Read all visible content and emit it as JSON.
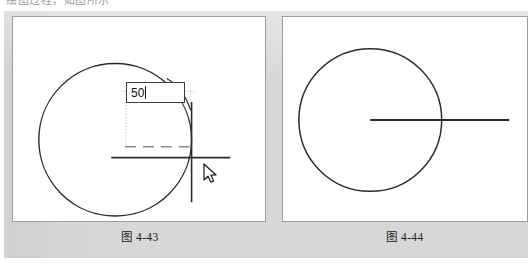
{
  "page": {
    "cropped_top_text": "绘图过程，如图所示"
  },
  "colors": {
    "plate_background": "#d7d7d7",
    "canvas_background": "#ffffff",
    "canvas_border": "#9c9c9c",
    "geometry_stroke": "#2b2b2b",
    "guide_dotted": "#b9b9b9",
    "guide_dashed": "#8a8a8a",
    "input_border": "#3d3d3d",
    "input_text": "#111111"
  },
  "figures": [
    {
      "id": "figure-4-43",
      "caption": "图 4-43",
      "canvas": {
        "width": 254,
        "height": 206
      },
      "circle": {
        "cx": 103,
        "cy": 124,
        "r": 77
      },
      "horizontal_line": {
        "x1": 99,
        "y1": 142,
        "x2": 219,
        "y2": 142
      },
      "vertical_line": {
        "x1": 180,
        "y1": 86,
        "x2": 180,
        "y2": 187
      },
      "guides": {
        "dotted_vertical_left": {
          "x": 114,
          "y1": 74,
          "y2": 131
        },
        "dotted_vertical_right": {
          "x": 179,
          "y1": 74,
          "y2": 88
        },
        "dotted_horizontal_top": {
          "y": 75,
          "x1": 110,
          "x2": 183
        },
        "dashed_horizontal": {
          "y": 131,
          "x1": 113,
          "x2": 180
        }
      },
      "leader_line": {
        "x1": 155,
        "y1": 62,
        "x2": 179,
        "y2": 93
      },
      "input": {
        "value": "50",
        "placeholder": "",
        "caret_visible": true
      },
      "cursor": {
        "x": 190,
        "y": 146,
        "kind": "arrow-pointer"
      }
    },
    {
      "id": "figure-4-44",
      "caption": "图 4-44",
      "canvas": {
        "width": 246,
        "height": 206
      },
      "circle": {
        "cx": 88,
        "cy": 104,
        "r": 72
      },
      "radius_line": {
        "x1": 88,
        "y1": 104,
        "x2": 228,
        "y2": 104
      }
    }
  ]
}
